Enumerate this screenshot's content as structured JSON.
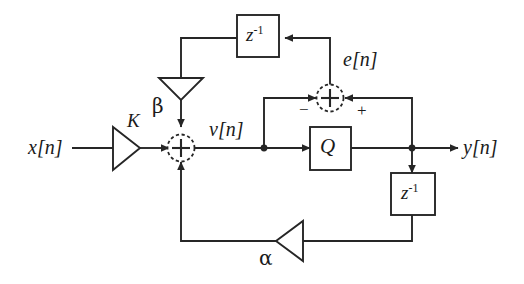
{
  "diagram": {
    "stroke_color": "#262626",
    "background": "#ffffff",
    "signals": {
      "input": "x[n]",
      "node_v": "v[n]",
      "error": "e[n]",
      "output": "y[n]"
    },
    "gains": {
      "forward": "K",
      "beta": "β",
      "alpha": "α"
    },
    "blocks": {
      "delay_top": {
        "base": "z",
        "exp": "-1"
      },
      "delay_right": {
        "base": "z",
        "exp": "-1"
      },
      "quantizer": "Q"
    },
    "adders": {
      "main_sum": "+",
      "error_sum": "+",
      "error_sum_minus": "−",
      "error_sum_plus": "+"
    }
  }
}
